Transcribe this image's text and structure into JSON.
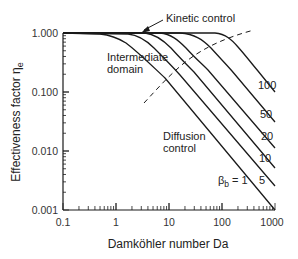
{
  "chart_data": {
    "type": "line",
    "title": "",
    "xlabel": "Damköhler number Da",
    "ylabel": "Effectiveness factor η",
    "ylabel_subscript": "e",
    "xscale": "log",
    "yscale": "log",
    "xlim": [
      0.1,
      1000
    ],
    "ylim": [
      0.001,
      1.0
    ],
    "grid": false,
    "legend": "none (curves labeled inline)",
    "x_tick_labels": [
      "0.1",
      "1",
      "10",
      "100",
      "1000"
    ],
    "y_tick_labels": [
      "0.001",
      "0.010",
      "0.100",
      "1.000"
    ],
    "series": [
      {
        "name": "β_b = 1",
        "label": "βb = 1",
        "x": [
          0.1,
          1,
          2,
          3,
          5,
          10,
          100,
          1000
        ],
        "values": [
          1.0,
          0.93,
          0.8,
          0.65,
          0.45,
          0.25,
          0.03,
          0.003
        ]
      },
      {
        "name": "β_b = 5",
        "label": "5",
        "x": [
          0.1,
          1,
          3,
          5,
          10,
          20,
          100,
          1000
        ],
        "values": [
          1.0,
          1.0,
          0.95,
          0.85,
          0.6,
          0.35,
          0.07,
          0.007
        ]
      },
      {
        "name": "β_b = 10",
        "label": "10",
        "x": [
          0.1,
          1,
          5,
          10,
          20,
          40,
          100,
          1000
        ],
        "values": [
          1.0,
          1.0,
          0.97,
          0.85,
          0.55,
          0.3,
          0.12,
          0.012
        ]
      },
      {
        "name": "β_b = 20",
        "label": "20",
        "x": [
          0.1,
          1,
          10,
          20,
          40,
          80,
          100,
          1000
        ],
        "values": [
          1.0,
          1.0,
          0.97,
          0.85,
          0.55,
          0.3,
          0.24,
          0.024
        ]
      },
      {
        "name": "β_b = 50",
        "label": "50",
        "x": [
          0.1,
          1,
          20,
          50,
          100,
          200,
          1000
        ],
        "values": [
          1.0,
          1.0,
          0.98,
          0.85,
          0.55,
          0.3,
          0.06
        ]
      },
      {
        "name": "β_b = 100",
        "label": "100",
        "x": [
          0.1,
          1,
          50,
          100,
          200,
          400,
          1000
        ],
        "values": [
          1.0,
          1.0,
          0.98,
          0.85,
          0.55,
          0.3,
          0.12
        ]
      }
    ],
    "boundary_line": {
      "style": "dashed",
      "description": "boundary between intermediate domain and diffusion control",
      "x": [
        3,
        10,
        100,
        500
      ],
      "values": [
        0.04,
        0.2,
        0.6,
        0.9
      ]
    },
    "annotations": [
      {
        "text": "Kinetic control",
        "arrow_to": {
          "x": 3,
          "y": 1.0
        }
      },
      {
        "text": "Intermediate domain"
      },
      {
        "text": "Diffusion control"
      }
    ]
  },
  "labels": {
    "xlabel": "Damköhler number Da",
    "ylabel": "Effectiveness factor η",
    "ylabel_sub": "e",
    "kinetic": "Kinetic control",
    "intermediate_1": "Intermediate",
    "intermediate_2": "domain",
    "diffusion_1": "Diffusion",
    "diffusion_2": "control",
    "beta_symbol": "β",
    "beta_sub": "b",
    "beta_value": " = 1",
    "curve_100": "100",
    "curve_50": "50",
    "curve_20": "20",
    "curve_10": "10",
    "curve_5": "5",
    "x_ticks": [
      "0.1",
      "1",
      "10",
      "100",
      "1000"
    ],
    "y_ticks": [
      "1.000",
      "0.100",
      "0.010",
      "0.001"
    ]
  }
}
